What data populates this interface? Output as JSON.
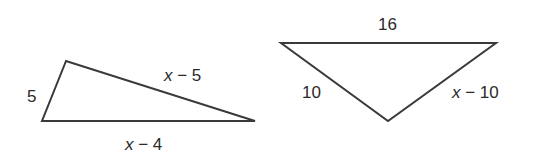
{
  "figures": [
    {
      "name": "triangle-left",
      "vertices": [
        [
          66,
          61
        ],
        [
          42,
          121
        ],
        [
          255,
          121
        ]
      ],
      "labels": {
        "side_a": "5",
        "side_b_var": "x",
        "side_b_rest": " − 5",
        "side_c_var": "x",
        "side_c_rest": " − 4"
      }
    },
    {
      "name": "triangle-right",
      "vertices": [
        [
          281,
          43
        ],
        [
          496,
          43
        ],
        [
          388,
          121
        ]
      ],
      "labels": {
        "top": "16",
        "left": "10",
        "right_var": "x",
        "right_rest": " − 10"
      }
    }
  ],
  "colors": {
    "stroke": "#3a3a3a",
    "text": "#2a2a2a"
  }
}
